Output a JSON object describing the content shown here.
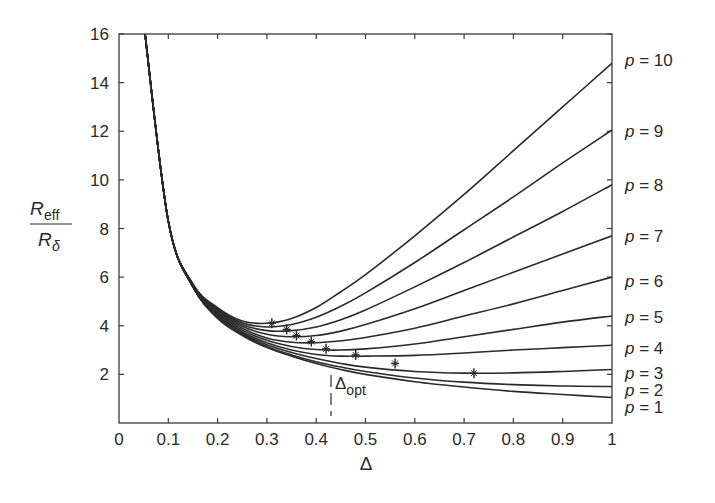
{
  "chart_data": {
    "type": "line",
    "title": "",
    "xlabel": "Δ",
    "ylabel": "R_eff / R_δ",
    "ylabel_num": "R",
    "ylabel_num_sub": "eff",
    "ylabel_den": "R",
    "ylabel_den_sub": "δ",
    "xlim": [
      0,
      1
    ],
    "ylim": [
      0,
      16
    ],
    "xticks": [
      "0",
      "0.1",
      "0.2",
      "0.3",
      "0.4",
      "0.5",
      "0.6",
      "0.7",
      "0.8",
      "0.9",
      "1"
    ],
    "yticks": [
      "2",
      "4",
      "6",
      "8",
      "10",
      "12",
      "14",
      "16"
    ],
    "grid": false,
    "annotation": {
      "text": "Δ",
      "sub": "opt",
      "x": 0.42
    },
    "x": [
      0.05,
      0.1,
      0.15,
      0.2,
      0.25,
      0.3,
      0.35,
      0.4,
      0.45,
      0.5,
      0.6,
      0.7,
      0.8,
      0.9,
      1.0
    ],
    "series": [
      {
        "name": "p = 1",
        "label": "1",
        "values": [
          16.5,
          8.3,
          5.6,
          4.3,
          3.6,
          3.1,
          2.75,
          2.45,
          2.2,
          2.0,
          1.7,
          1.48,
          1.3,
          1.17,
          1.05
        ]
      },
      {
        "name": "p = 2",
        "label": "2",
        "values": [
          16.5,
          8.3,
          5.6,
          4.35,
          3.65,
          3.15,
          2.8,
          2.52,
          2.3,
          2.12,
          1.85,
          1.68,
          1.58,
          1.52,
          1.5
        ]
      },
      {
        "name": "p = 3",
        "label": "3",
        "values": [
          16.5,
          8.3,
          5.6,
          4.4,
          3.7,
          3.22,
          2.9,
          2.65,
          2.45,
          2.3,
          2.12,
          2.05,
          2.06,
          2.12,
          2.2
        ]
      },
      {
        "name": "p = 4",
        "label": "4",
        "values": [
          16.5,
          8.3,
          5.6,
          4.45,
          3.75,
          3.3,
          3.0,
          2.82,
          2.75,
          2.75,
          2.78,
          2.88,
          3.0,
          3.1,
          3.2
        ]
      },
      {
        "name": "p = 5",
        "label": "5",
        "values": [
          16.5,
          8.3,
          5.6,
          4.5,
          3.82,
          3.4,
          3.15,
          3.02,
          3.0,
          3.05,
          3.25,
          3.55,
          3.85,
          4.15,
          4.4
        ]
      },
      {
        "name": "p = 6",
        "label": "6",
        "values": [
          16.5,
          8.3,
          5.62,
          4.55,
          3.9,
          3.5,
          3.32,
          3.3,
          3.38,
          3.52,
          3.9,
          4.4,
          4.9,
          5.45,
          6.0
        ]
      },
      {
        "name": "p = 7",
        "label": "7",
        "values": [
          16.5,
          8.3,
          5.65,
          4.6,
          3.98,
          3.65,
          3.55,
          3.6,
          3.78,
          4.05,
          4.7,
          5.45,
          6.2,
          6.95,
          7.7
        ]
      },
      {
        "name": "p = 8",
        "label": "8",
        "values": [
          16.5,
          8.3,
          5.68,
          4.65,
          4.05,
          3.8,
          3.8,
          3.95,
          4.25,
          4.65,
          5.6,
          6.6,
          7.65,
          8.7,
          9.8
        ]
      },
      {
        "name": "p = 9",
        "label": "9",
        "values": [
          16.5,
          8.3,
          5.7,
          4.7,
          4.12,
          3.95,
          4.05,
          4.35,
          4.8,
          5.35,
          6.6,
          7.95,
          9.3,
          10.7,
          12.05
        ]
      },
      {
        "name": "p = 10",
        "label": "10",
        "values": [
          16.5,
          8.3,
          5.72,
          4.75,
          4.2,
          4.1,
          4.3,
          4.75,
          5.4,
          6.1,
          7.7,
          9.4,
          11.2,
          13.0,
          14.8
        ]
      }
    ],
    "optimum_markers": [
      {
        "p": 10,
        "x": 0.31,
        "y": 4.1
      },
      {
        "p": 9,
        "x": 0.34,
        "y": 3.85
      },
      {
        "p": 8,
        "x": 0.36,
        "y": 3.6
      },
      {
        "p": 7,
        "x": 0.39,
        "y": 3.35
      },
      {
        "p": 6,
        "x": 0.42,
        "y": 3.05
      },
      {
        "p": 5,
        "x": 0.48,
        "y": 2.8
      },
      {
        "p": 4,
        "x": 0.56,
        "y": 2.45
      },
      {
        "p": 3,
        "x": 0.72,
        "y": 2.05
      }
    ],
    "right_labels": [
      {
        "text": "p",
        "eq": " = 10",
        "y": 14.8,
        "label_y_px": 60
      },
      {
        "text": "p",
        "eq": " = 9",
        "y": 12.05,
        "label_y_px": 131
      },
      {
        "text": "p",
        "eq": " = 8",
        "y": 9.8,
        "label_y_px": 185
      },
      {
        "text": "p",
        "eq": " = 7",
        "y": 7.7,
        "label_y_px": 236
      },
      {
        "text": "p",
        "eq": " = 6",
        "y": 6.0,
        "label_y_px": 281
      },
      {
        "text": "p",
        "eq": " = 5",
        "y": 4.4,
        "label_y_px": 317
      },
      {
        "text": "p",
        "eq": " = 4",
        "y": 3.2,
        "label_y_px": 348
      },
      {
        "text": "p",
        "eq": " = 3",
        "y": 2.2,
        "label_y_px": 373
      },
      {
        "text": "p",
        "eq": " = 2",
        "y": 1.5,
        "label_y_px": 390
      },
      {
        "text": "p",
        "eq": " = 1",
        "y": 1.05,
        "label_y_px": 407
      }
    ],
    "line_color": "#2a2a2a"
  }
}
